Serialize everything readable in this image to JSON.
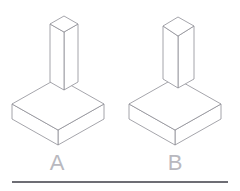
{
  "figure": {
    "background_color": "#ffffff",
    "line_color": "#8e8e96",
    "label_color": "#b9b9bf",
    "rule_color": "#6d6d74",
    "items": [
      {
        "id": "A",
        "label": "A",
        "label_x": 57,
        "label_y": 170,
        "description": "square slab base with tall narrow vertical rectangular column",
        "base": {
          "top_face": "12,104 58,78 104,104 58,130",
          "left_face": "12,104 12,119 58,145 58,130",
          "right_face": "58,130 58,145 104,119 104,104"
        },
        "column": {
          "top_face": "50,24 64,16 78,24 64,32",
          "left_face": "50,24 50,82 64,90 64,32",
          "right_face": "64,32 64,90 78,82 78,24"
        }
      },
      {
        "id": "B",
        "label": "B",
        "label_x": 175,
        "label_y": 170,
        "description": "square slab base with shorter wider vertical rectangular column",
        "base": {
          "top_face": "129,104 175,78 221,104 175,130",
          "left_face": "129,104 129,119 175,145 175,130",
          "right_face": "175,130 175,145 221,119 221,104"
        },
        "column": {
          "top_face": "163,26 178,17 194,26 178,36",
          "left_face": "163,26 163,79 178,88 178,36",
          "right_face": "178,36 178,88 194,79 194,26"
        }
      }
    ],
    "rule": {
      "x1": 12,
      "y1": 182,
      "x2": 228,
      "y2": 182
    }
  }
}
